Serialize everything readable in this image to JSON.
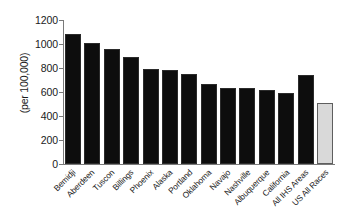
{
  "chart_data": {
    "type": "bar",
    "title": "",
    "subtitle": "",
    "xlabel": "",
    "ylabel": "(per 100,000)",
    "ylim": [
      0,
      1200
    ],
    "yticks": [
      0,
      200,
      400,
      600,
      800,
      1000,
      1200
    ],
    "ytick_labels": [
      "0",
      "200",
      "400",
      "600",
      "800",
      "1000",
      "1200"
    ],
    "grid": false,
    "legend": null,
    "categories": [
      "Bemidji",
      "Aberdeen",
      "Tuscon",
      "Billings",
      "Phoenix",
      "Alaska",
      "Portland",
      "Oklahoma",
      "Navajo",
      "Nashville",
      "Albuquerque",
      "California",
      "All IHS Areas",
      "US All Races"
    ],
    "values": [
      1080,
      1010,
      960,
      890,
      790,
      785,
      750,
      670,
      637,
      630,
      620,
      592,
      742,
      512
    ],
    "bar_colors": [
      "#0d0d0d",
      "#0d0d0d",
      "#0d0d0d",
      "#0d0d0d",
      "#0d0d0d",
      "#0d0d0d",
      "#0d0d0d",
      "#0d0d0d",
      "#0d0d0d",
      "#0d0d0d",
      "#0d0d0d",
      "#0d0d0d",
      "#0d0d0d",
      "#d9d9d9"
    ],
    "highlight_index": 13,
    "axis_color": "#7a7a7a",
    "text_color": "#1a1a1a",
    "background": "#ffffff"
  }
}
